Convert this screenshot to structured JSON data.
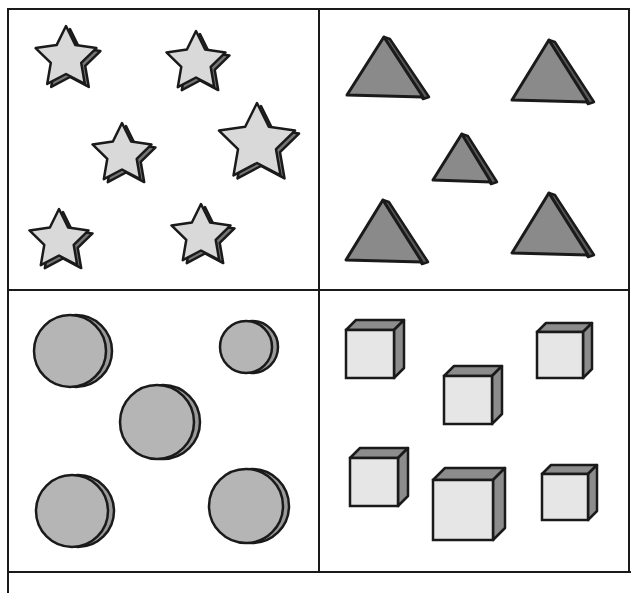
{
  "colors": {
    "line": "#1a1a1a",
    "star_fill": "#d9d9d9",
    "triangle_fill": "#8a8a8a",
    "circle_fill": "#b5b5b5",
    "cube_face": "#e6e6e6",
    "cube_side": "#8c8c8c"
  },
  "panels": [
    {
      "name": "stars",
      "shape": "star",
      "count": 6,
      "items": [
        {
          "cx": 66,
          "cy": 58,
          "r": 32
        },
        {
          "cx": 196,
          "cy": 62,
          "r": 31
        },
        {
          "cx": 122,
          "cy": 154,
          "r": 31
        },
        {
          "cx": 257,
          "cy": 143,
          "r": 40
        },
        {
          "cx": 59,
          "cy": 240,
          "r": 31
        },
        {
          "cx": 201,
          "cy": 235,
          "r": 31
        }
      ]
    },
    {
      "name": "triangles",
      "shape": "triangle",
      "count": 5,
      "items": [
        {
          "x": 347,
          "y": 37,
          "w": 82,
          "h": 60
        },
        {
          "x": 512,
          "y": 40,
          "w": 82,
          "h": 62
        },
        {
          "x": 433,
          "y": 134,
          "w": 64,
          "h": 48
        },
        {
          "x": 346,
          "y": 200,
          "w": 82,
          "h": 62
        },
        {
          "x": 512,
          "y": 193,
          "w": 82,
          "h": 62
        }
      ]
    },
    {
      "name": "circles",
      "shape": "circle",
      "count": 5,
      "items": [
        {
          "cx": 70,
          "cy": 351,
          "r": 36
        },
        {
          "cx": 246,
          "cy": 347,
          "r": 26
        },
        {
          "cx": 157,
          "cy": 422,
          "r": 37
        },
        {
          "cx": 72,
          "cy": 511,
          "r": 36
        },
        {
          "cx": 246,
          "cy": 506,
          "r": 37
        }
      ]
    },
    {
      "name": "cubes",
      "shape": "cube",
      "count": 6,
      "items": [
        {
          "x": 346,
          "y": 320,
          "s": 48
        },
        {
          "x": 537,
          "y": 323,
          "s": 46
        },
        {
          "x": 444,
          "y": 366,
          "s": 48
        },
        {
          "x": 350,
          "y": 448,
          "s": 48
        },
        {
          "x": 433,
          "y": 468,
          "s": 60
        },
        {
          "x": 542,
          "y": 465,
          "s": 46
        }
      ]
    }
  ]
}
